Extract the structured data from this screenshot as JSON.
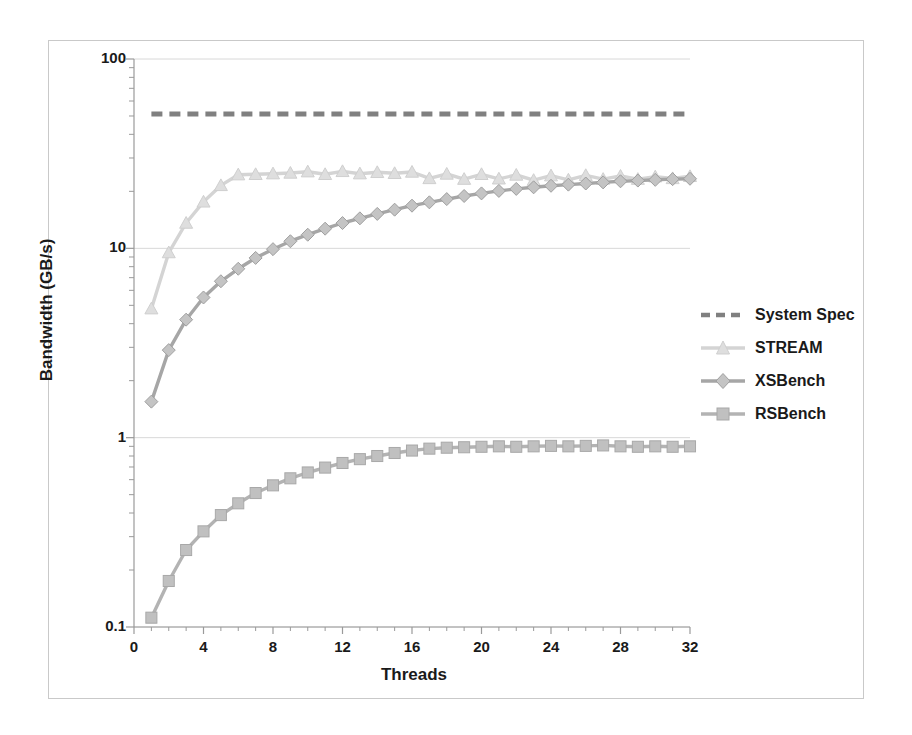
{
  "chart_data": {
    "type": "line",
    "title": "",
    "xlabel": "Threads",
    "ylabel": "Bandwidth (GB/s)",
    "yscale": "log",
    "ylim": [
      0.1,
      100
    ],
    "xlim": [
      0,
      32
    ],
    "xticks": [
      "0",
      "4",
      "8",
      "12",
      "16",
      "20",
      "24",
      "28",
      "32"
    ],
    "yticks": [
      "0.1",
      "1",
      "10",
      "100"
    ],
    "grid": "horizontal-major",
    "legend_position": "right",
    "x": [
      1,
      2,
      3,
      4,
      5,
      6,
      7,
      8,
      9,
      10,
      11,
      12,
      13,
      14,
      15,
      16,
      17,
      18,
      19,
      20,
      21,
      22,
      23,
      24,
      25,
      26,
      27,
      28,
      29,
      30,
      31,
      32
    ],
    "series": [
      {
        "name": "System Spec",
        "style": "dashed",
        "marker": "none",
        "color": "#808080",
        "constant_value": 51.2,
        "values": [
          51.2,
          51.2,
          51.2,
          51.2,
          51.2,
          51.2,
          51.2,
          51.2,
          51.2,
          51.2,
          51.2,
          51.2,
          51.2,
          51.2,
          51.2,
          51.2,
          51.2,
          51.2,
          51.2,
          51.2,
          51.2,
          51.2,
          51.2,
          51.2,
          51.2,
          51.2,
          51.2,
          51.2,
          51.2,
          51.2,
          51.2,
          51.2
        ]
      },
      {
        "name": "STREAM",
        "style": "solid",
        "marker": "triangle",
        "color": "#d4d4d4",
        "values": [
          4.8,
          9.5,
          13.6,
          17.6,
          21.5,
          24.5,
          24.6,
          24.8,
          25.0,
          25.4,
          24.6,
          25.5,
          24.8,
          25.2,
          24.9,
          25.3,
          23.4,
          24.7,
          23.2,
          24.6,
          23.3,
          24.4,
          22.9,
          24.2,
          23.0,
          24.3,
          23.2,
          24.1,
          23.2,
          23.9,
          23.4,
          24.0
        ]
      },
      {
        "name": "XSBench",
        "style": "solid",
        "marker": "diamond",
        "color": "#a6a6a6",
        "values": [
          1.55,
          2.9,
          4.2,
          5.5,
          6.7,
          7.8,
          8.9,
          9.9,
          10.9,
          11.8,
          12.7,
          13.6,
          14.4,
          15.2,
          16.0,
          16.8,
          17.5,
          18.2,
          18.9,
          19.5,
          20.1,
          20.6,
          21.0,
          21.4,
          21.7,
          22.0,
          22.3,
          22.6,
          22.8,
          23.0,
          23.2,
          23.3
        ]
      },
      {
        "name": "RSBench",
        "style": "solid",
        "marker": "square",
        "color": "#b3b3b3",
        "values": [
          0.112,
          0.175,
          0.255,
          0.32,
          0.39,
          0.45,
          0.51,
          0.56,
          0.61,
          0.655,
          0.695,
          0.735,
          0.77,
          0.8,
          0.83,
          0.855,
          0.875,
          0.885,
          0.89,
          0.895,
          0.9,
          0.895,
          0.9,
          0.905,
          0.9,
          0.905,
          0.91,
          0.9,
          0.895,
          0.9,
          0.895,
          0.9
        ]
      }
    ]
  },
  "legend": {
    "items": [
      {
        "label": "System Spec"
      },
      {
        "label": "STREAM"
      },
      {
        "label": "XSBench"
      },
      {
        "label": "RSBench"
      }
    ]
  }
}
